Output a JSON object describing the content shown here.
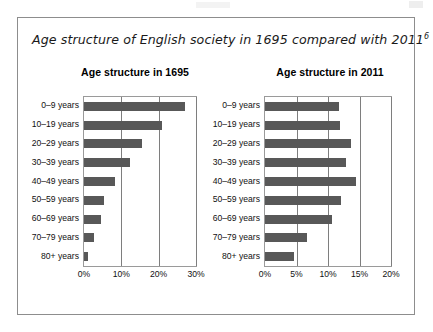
{
  "figure": {
    "title_text": "Age structure of English society in 1695 compared with 2011",
    "title_footnote": "6"
  },
  "chart_data": [
    {
      "type": "bar",
      "title": "Age structure in 1695",
      "orientation": "horizontal",
      "categories": [
        "80+ years",
        "70–79 years",
        "60–69 years",
        "50–59 years",
        "40–49 years",
        "30–39 years",
        "20–29 years",
        "10–19 years",
        "0–9 years"
      ],
      "values": [
        1.2,
        2.6,
        4.6,
        5.4,
        8.4,
        12.2,
        15.5,
        21.0,
        27.0
      ],
      "xlabel": "",
      "ylabel": "",
      "xlim": [
        0,
        30
      ],
      "xticks": [
        0,
        10,
        20,
        30
      ],
      "xticklabels": [
        "0%",
        "10%",
        "20%",
        "30%"
      ],
      "grid": true,
      "legend": false,
      "bar_color": "#585858"
    },
    {
      "type": "bar",
      "title": "Age structure in 2011",
      "orientation": "horizontal",
      "categories": [
        "80+ years",
        "70–79 years",
        "60–69 years",
        "50–59 years",
        "40–49 years",
        "30–39 years",
        "20–29 years",
        "10–19 years",
        "0–9 years"
      ],
      "values": [
        4.6,
        6.7,
        10.6,
        12.1,
        14.5,
        12.8,
        13.6,
        11.9,
        11.8
      ],
      "xlabel": "",
      "ylabel": "",
      "xlim": [
        0,
        20
      ],
      "xticks": [
        0,
        5,
        10,
        15,
        20
      ],
      "xticklabels": [
        "0%",
        "5%",
        "10%",
        "15%",
        "20%"
      ],
      "grid": true,
      "legend": false,
      "bar_color": "#585858"
    }
  ]
}
